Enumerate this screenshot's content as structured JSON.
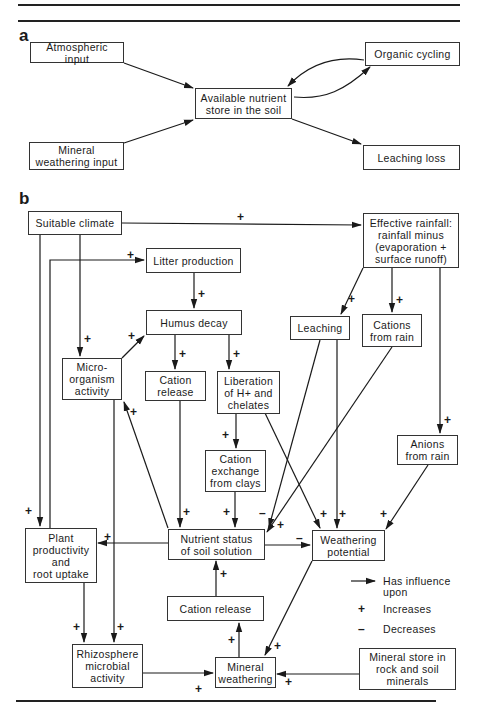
{
  "panels": {
    "a": {
      "label": "a",
      "nodes": {
        "atmospheric_input": "Atmospheric input",
        "organic_cycling": "Organic cycling",
        "available_store": "Available nutrient\nstore in the soil",
        "mineral_weathering_input": "Mineral\nweathering input",
        "leaching_loss": "Leaching loss"
      },
      "edges": [
        {
          "from": "atmospheric_input",
          "to": "available_store"
        },
        {
          "from": "mineral_weathering_input",
          "to": "available_store"
        },
        {
          "from": "available_store",
          "to": "organic_cycling"
        },
        {
          "from": "organic_cycling",
          "to": "available_store"
        },
        {
          "from": "available_store",
          "to": "leaching_loss"
        }
      ]
    },
    "b": {
      "label": "b",
      "nodes": {
        "suitable_climate": "Suitable climate",
        "effective_rainfall": "Effective rainfall:\nrainfall minus\n(evaporation +\nsurface runoff)",
        "litter_production": "Litter production",
        "humus_decay": "Humus decay",
        "leaching": "Leaching",
        "cations_from_rain": "Cations\nfrom rain",
        "micro_organism_activity": "Micro-\norganism\nactivity",
        "cation_release_upper": "Cation\nrelease",
        "liberation_h": "Liberation\nof H+ and\nchelates",
        "cation_exchange": "Cation\nexchange\nfrom clays",
        "anions_from_rain": "Anions\nfrom rain",
        "plant_productivity": "Plant\nproductivity\nand\nroot uptake",
        "nutrient_status": "Nutrient status\nof soil solution",
        "weathering_potential": "Weathering\npotential",
        "cation_release_lower": "Cation release",
        "rhizosphere": "Rhizosphere\nmicrobial\nactivity",
        "mineral_weathering": "Mineral\nweathering",
        "mineral_store": "Mineral store in\nrock and soil\nminerals"
      },
      "edges": [
        {
          "from": "suitable_climate",
          "to": "effective_rainfall",
          "sign": "+"
        },
        {
          "from": "suitable_climate",
          "to": "micro_organism_activity",
          "sign": "+"
        },
        {
          "from": "suitable_climate",
          "to": "plant_productivity",
          "sign": "+"
        },
        {
          "from": "plant_productivity",
          "to": "litter_production",
          "sign": "+"
        },
        {
          "from": "litter_production",
          "to": "humus_decay",
          "sign": "+"
        },
        {
          "from": "micro_organism_activity",
          "to": "humus_decay",
          "sign": "+"
        },
        {
          "from": "humus_decay",
          "to": "cation_release_upper",
          "sign": "+"
        },
        {
          "from": "humus_decay",
          "to": "liberation_h",
          "sign": "+"
        },
        {
          "from": "effective_rainfall",
          "to": "leaching",
          "sign": "+"
        },
        {
          "from": "effective_rainfall",
          "to": "cations_from_rain",
          "sign": "+"
        },
        {
          "from": "effective_rainfall",
          "to": "anions_from_rain",
          "sign": "+"
        },
        {
          "from": "liberation_h",
          "to": "cation_exchange",
          "sign": "+"
        },
        {
          "from": "liberation_h",
          "to": "weathering_potential",
          "sign": "+"
        },
        {
          "from": "cation_release_upper",
          "to": "nutrient_status",
          "sign": "+"
        },
        {
          "from": "cation_exchange",
          "to": "nutrient_status",
          "sign": "+"
        },
        {
          "from": "leaching",
          "to": "nutrient_status",
          "sign": "-"
        },
        {
          "from": "leaching",
          "to": "weathering_potential",
          "sign": "+"
        },
        {
          "from": "cations_from_rain",
          "to": "nutrient_status",
          "sign": "+"
        },
        {
          "from": "anions_from_rain",
          "to": "weathering_potential",
          "sign": "+"
        },
        {
          "from": "nutrient_status",
          "to": "micro_organism_activity",
          "sign": "+"
        },
        {
          "from": "nutrient_status",
          "to": "plant_productivity",
          "sign": "+"
        },
        {
          "from": "nutrient_status",
          "to": "weathering_potential",
          "sign": "-"
        },
        {
          "from": "micro_organism_activity",
          "to": "rhizosphere",
          "sign": "+"
        },
        {
          "from": "plant_productivity",
          "to": "rhizosphere",
          "sign": "+"
        },
        {
          "from": "rhizosphere",
          "to": "mineral_weathering",
          "sign": "+"
        },
        {
          "from": "weathering_potential",
          "to": "mineral_weathering",
          "sign": "+"
        },
        {
          "from": "mineral_store",
          "to": "mineral_weathering",
          "sign": "+"
        },
        {
          "from": "mineral_weathering",
          "to": "cation_release_lower",
          "sign": "+"
        },
        {
          "from": "cation_release_lower",
          "to": "nutrient_status",
          "sign": "+"
        }
      ],
      "legend": {
        "arrow": "Has influence\nupon",
        "plus_symbol": "+",
        "plus": "Increases",
        "minus_symbol": "–",
        "minus": "Decreases"
      },
      "signs": {
        "plus": "+",
        "minus": "–"
      }
    }
  }
}
